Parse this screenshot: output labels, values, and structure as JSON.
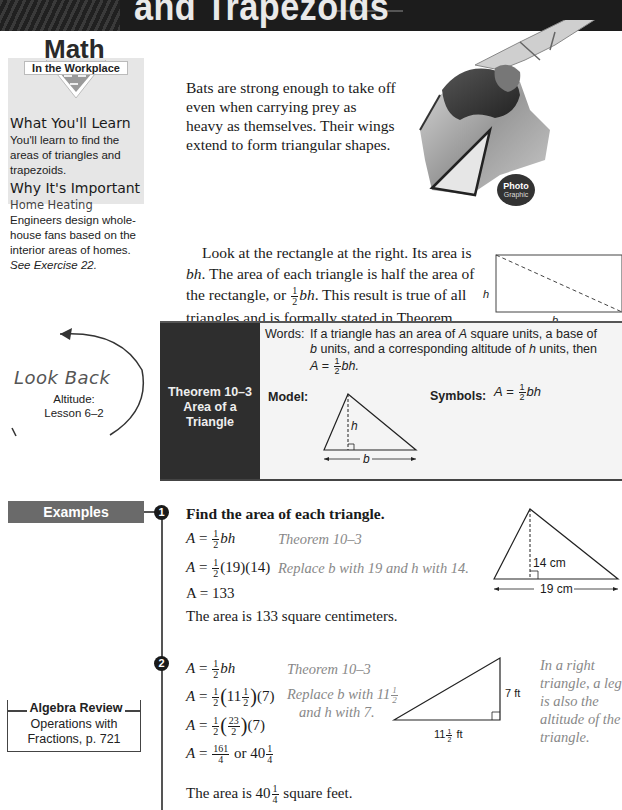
{
  "header": {
    "title": "and Trapezoids"
  },
  "sidebar": {
    "logo_big": "Math",
    "logo_small": "In the Workplace",
    "what_learn_heading": "What You'll Learn",
    "what_learn_text": "You'll learn to find the areas of triangles and trapezoids.",
    "why_heading": "Why It's Important",
    "why_sub": "Home Heating",
    "why_text": "Engineers design whole-house fans based on the interior areas of homes.",
    "why_ref": "See Exercise 22."
  },
  "intro": {
    "text": "Bats are strong enough to take off even when carrying prey as heavy as themselves. Their wings extend to form triangular shapes."
  },
  "photo_badge": {
    "line1": "Photo",
    "line2": "Graphic"
  },
  "paragraph": {
    "part1": "Look at the rectangle at the right. Its area is ",
    "bh": "bh",
    "part2": ". The area of each triangle is half the area of the rectangle, or ",
    "frac_n": "1",
    "frac_d": "2",
    "bh2": "bh",
    "part3": ". This result is true of all triangles and is formally stated in Theorem 10–3."
  },
  "rect_diagram": {
    "h_label": "h",
    "b_label": "b"
  },
  "theorem": {
    "title": "Theorem 10–3\nArea of a\nTriangle",
    "title_line1": "Theorem 10–3",
    "title_line2": "Area of a",
    "title_line3": "Triangle",
    "words_label": "Words:",
    "words_text_1": "If a triangle has an area of ",
    "words_A": "A",
    "words_text_2": " square units, a base of ",
    "words_b": "b",
    "words_text_3": " units, and a corresponding altitude of ",
    "words_h": "h",
    "words_text_4": " units, then",
    "words_formula_A": "A",
    "words_formula_eq": " = ",
    "words_formula_bh": "bh.",
    "model_label": "Model:",
    "model_h": "h",
    "model_b": "b",
    "symbols_label": "Symbols:",
    "symbols_A": "A",
    "symbols_eq": " = ",
    "symbols_bh": "bh"
  },
  "look_back": {
    "title": "Look Back",
    "line1": "Altitude:",
    "line2": "Lesson 6–2"
  },
  "examples": {
    "tab_label": "Examples",
    "ex1": {
      "number": "1",
      "heading": "Find the area of each triangle.",
      "steps": [
        {
          "eq": "A = ½bh",
          "note": "Theorem 10–3"
        },
        {
          "eq": "A = ½(19)(14)",
          "note": "Replace b with 19 and h with 14."
        },
        {
          "eq": "A = 133",
          "note": ""
        }
      ],
      "conclusion": "The area is 133 square centimeters.",
      "diagram": {
        "height_label": "14 cm",
        "base_label": "19 cm"
      }
    },
    "ex2": {
      "number": "2",
      "steps": [
        {
          "eq": "A = ½bh",
          "note": "Theorem 10–3"
        },
        {
          "eq": "A = ½(11½)(7)",
          "note": "Replace b with 11½ and h with 7."
        },
        {
          "eq": "A = ½(23/2)(7)",
          "note": ""
        },
        {
          "eq": "A = 161/4 or 40¼",
          "note": ""
        }
      ],
      "note_line1": "Replace b with 11",
      "note_line2": "and h with 7.",
      "conclusion_pre": "The area is 40",
      "conclusion_post": " square feet.",
      "diagram": {
        "height_label": "7 ft",
        "base_label": "11½ ft"
      },
      "side_note": "In a right triangle, a leg is also the altitude of the triangle."
    }
  },
  "algebra_review": {
    "title": "Algebra Review",
    "text_line1": "Operations with",
    "text_line2": "Fractions, p. 721"
  }
}
